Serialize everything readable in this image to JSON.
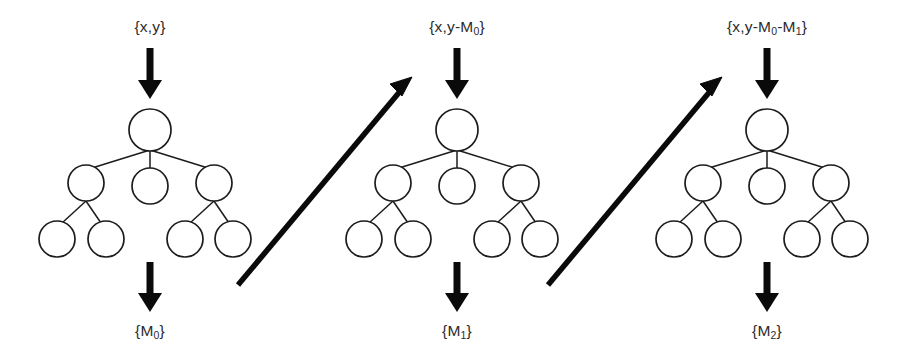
{
  "diagram": {
    "type": "process-flow",
    "background_color": "#ffffff",
    "ink_color": "#1a1a1a",
    "panel_count": 3,
    "panels": [
      {
        "id": "stage-0",
        "input_label": "{x,y}",
        "input_label_base": "{x,y}",
        "output_label_base": "{M",
        "output_label_sub": "0",
        "output_label_tail": "}",
        "output_label": "{M0}"
      },
      {
        "id": "stage-1",
        "input_label": "{x,y-M0}",
        "input_prefix": "{x,y-M",
        "input_sub": "0",
        "input_tail": "}",
        "output_label_base": "{M",
        "output_label_sub": "1",
        "output_label_tail": "}",
        "output_label": "{M1}"
      },
      {
        "id": "stage-2",
        "input_label": "{x,y-M0-M1}",
        "input_prefix": "{x,y-M",
        "input_sub": "0",
        "input_mid": "-M",
        "input_sub2": "1",
        "input_tail": "}",
        "output_label_base": "{M",
        "output_label_sub": "2",
        "output_label_tail": "}",
        "output_label": "{M2}"
      }
    ],
    "tree": {
      "description": "tree with root, three children, and two grandchildren under the outer children",
      "node_count": 8,
      "levels": 3,
      "nodes": [
        {
          "id": "root",
          "level": 0,
          "cx": 150,
          "cy": 130,
          "r": 21
        },
        {
          "id": "child-left",
          "level": 1,
          "cx": 86,
          "cy": 183,
          "r": 18
        },
        {
          "id": "child-mid",
          "level": 1,
          "cx": 150,
          "cy": 186,
          "r": 18
        },
        {
          "id": "child-right",
          "level": 1,
          "cx": 214,
          "cy": 183,
          "r": 18
        },
        {
          "id": "leaf-1",
          "level": 2,
          "cx": 57,
          "cy": 239,
          "r": 18
        },
        {
          "id": "leaf-2",
          "level": 2,
          "cx": 106,
          "cy": 239,
          "r": 18
        },
        {
          "id": "leaf-3",
          "level": 2,
          "cx": 185,
          "cy": 239,
          "r": 18
        },
        {
          "id": "leaf-4",
          "level": 2,
          "cx": 233,
          "cy": 239,
          "r": 18
        }
      ],
      "edges": [
        {
          "from": "root",
          "to": "child-left"
        },
        {
          "from": "root",
          "to": "child-mid"
        },
        {
          "from": "root",
          "to": "child-right"
        },
        {
          "from": "child-left",
          "to": "leaf-1"
        },
        {
          "from": "child-left",
          "to": "leaf-2"
        },
        {
          "from": "child-right",
          "to": "leaf-3"
        },
        {
          "from": "child-right",
          "to": "leaf-4"
        }
      ]
    },
    "vertical_arrows": [
      {
        "id": "input-arrow",
        "direction": "down",
        "x": 150,
        "y_start": 48,
        "y_end": 99
      },
      {
        "id": "output-arrow",
        "direction": "down",
        "x": 150,
        "y_start": 262,
        "y_end": 312
      }
    ],
    "transition_arrows": [
      {
        "id": "transition-0-to-1",
        "direction": "up-right",
        "x1": 238,
        "y1": 285,
        "x2": 412,
        "y2": 77
      },
      {
        "id": "transition-1-to-2",
        "direction": "up-right",
        "x1": 548,
        "y1": 285,
        "x2": 722,
        "y2": 77
      }
    ]
  }
}
